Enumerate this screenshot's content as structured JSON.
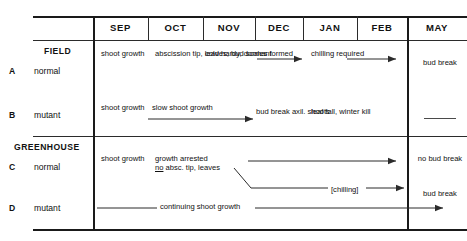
{
  "figure": {
    "months": [
      {
        "label": "SEP"
      },
      {
        "label": "OCT"
      },
      {
        "label": "NOV"
      },
      {
        "label": "DEC"
      },
      {
        "label": "JAN"
      },
      {
        "label": "FEB"
      },
      {
        "label": "MAY"
      }
    ],
    "groups": [
      {
        "name": "FIELD"
      },
      {
        "name": "GREENHOUSE"
      }
    ],
    "rows": [
      {
        "letter": "A",
        "group": "FIELD",
        "type": "normal",
        "cells": {
          "sep": "shoot\ngrowth",
          "oct": "abscission\ntip, leaves;\nbud scales\nformed",
          "nov": "cold hardy,\ndormant",
          "jan": "chilling\nrequired",
          "may": "bud\nbreak"
        }
      },
      {
        "letter": "B",
        "group": "FIELD",
        "type": "mutant",
        "cells": {
          "sep": "shoot\ngrowth",
          "oct_nov": "slow shoot growth",
          "dec": "bud break\naxil. shoots",
          "jan": "leaf fall,\nwinter kill",
          "may": ""
        }
      },
      {
        "letter": "C",
        "group": "GREENHOUSE",
        "type": "normal",
        "cells": {
          "sep": "shoot\ngrowth",
          "oct": "growth arrested\nno absc. tip, leaves",
          "oct_underlined_word": "no",
          "feb": "[chilling]",
          "may_top": "no bud\nbreak",
          "may_bottom": "bud break"
        }
      },
      {
        "letter": "D",
        "group": "GREENHOUSE",
        "type": "mutant",
        "cells": {
          "span": "continuing shoot growth"
        }
      }
    ],
    "colors": {
      "rule": "#2b2b2b",
      "text": "#111111",
      "background": "#ffffff"
    }
  }
}
